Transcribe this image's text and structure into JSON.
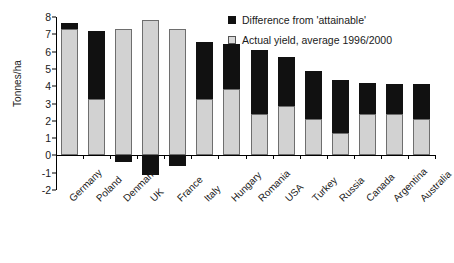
{
  "chart_data": {
    "type": "bar",
    "stacked": true,
    "title": "",
    "xlabel": "",
    "ylabel": "Tonnes/ha",
    "ylim": [
      -2,
      8
    ],
    "yticks": [
      8,
      7,
      6,
      5,
      4,
      3,
      2,
      1,
      0,
      -1,
      -2
    ],
    "grid": false,
    "legend_position": "top-right",
    "categories": [
      "Germany",
      "Poland",
      "Denmark",
      "UK",
      "France",
      "Italy",
      "Hungary",
      "Romania",
      "USA",
      "Turkey",
      "Russia",
      "Canada",
      "Argentina",
      "Australia"
    ],
    "series": [
      {
        "name": "Actual yield, average 1996/2000",
        "color": "#d2d2d2",
        "values": [
          7.3,
          3.25,
          7.3,
          7.8,
          7.3,
          3.25,
          3.85,
          2.4,
          2.85,
          2.1,
          1.3,
          2.4,
          2.4,
          2.1
        ]
      },
      {
        "name": "Difference from 'attainable'",
        "color": "#111111",
        "values": [
          0.35,
          3.95,
          -0.4,
          -1.15,
          -0.6,
          3.3,
          2.6,
          3.7,
          2.85,
          2.75,
          3.05,
          1.8,
          1.75,
          2.05
        ]
      }
    ],
    "totals": [
      7.65,
      7.2,
      6.9,
      6.65,
      6.7,
      6.55,
      6.45,
      6.1,
      5.7,
      4.85,
      4.35,
      4.2,
      4.15,
      4.15
    ]
  },
  "legend": {
    "items": [
      {
        "label": "Difference from 'attainable'",
        "swatch": "black-square-icon"
      },
      {
        "label": "Actual yield, average 1996/2000",
        "swatch": "grey-square-icon"
      }
    ]
  },
  "axis": {
    "y_title": "Tonnes/ha"
  }
}
